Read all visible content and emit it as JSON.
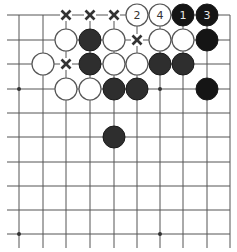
{
  "board": {
    "columns": 10,
    "rows": 10,
    "col_x": [
      19,
      43,
      66,
      90,
      114,
      137,
      160,
      183,
      207,
      230
    ],
    "row_y": [
      15,
      40,
      64,
      89,
      113,
      137,
      162,
      186,
      210,
      234
    ],
    "line_color": "#555555",
    "stone_radius": 11,
    "hoshi": [
      {
        "col": 0,
        "row": 3
      },
      {
        "col": 6,
        "row": 3
      },
      {
        "col": 0,
        "row": 9
      },
      {
        "col": 6,
        "row": 9
      }
    ]
  },
  "stones": [
    {
      "color": "white",
      "col": 5,
      "row": 0,
      "label": "2"
    },
    {
      "color": "white",
      "col": 6,
      "row": 0,
      "label": "4"
    },
    {
      "color": "black",
      "col": 7,
      "row": 0,
      "label": "1",
      "shade": "dark"
    },
    {
      "color": "black",
      "col": 8,
      "row": 0,
      "label": "3",
      "shade": "dark"
    },
    {
      "color": "white",
      "col": 2,
      "row": 1,
      "label": ""
    },
    {
      "color": "black",
      "col": 3,
      "row": 1,
      "label": ""
    },
    {
      "color": "white",
      "col": 4,
      "row": 1,
      "label": ""
    },
    {
      "color": "white",
      "col": 6,
      "row": 1,
      "label": ""
    },
    {
      "color": "white",
      "col": 7,
      "row": 1,
      "label": ""
    },
    {
      "color": "black",
      "col": 8,
      "row": 1,
      "label": "",
      "shade": "dark"
    },
    {
      "color": "white",
      "col": 1,
      "row": 2,
      "label": ""
    },
    {
      "color": "black",
      "col": 3,
      "row": 2,
      "label": ""
    },
    {
      "color": "white",
      "col": 4,
      "row": 2,
      "label": ""
    },
    {
      "color": "white",
      "col": 5,
      "row": 2,
      "label": ""
    },
    {
      "color": "black",
      "col": 6,
      "row": 2,
      "label": ""
    },
    {
      "color": "black",
      "col": 7,
      "row": 2,
      "label": ""
    },
    {
      "color": "white",
      "col": 2,
      "row": 3,
      "label": ""
    },
    {
      "color": "white",
      "col": 3,
      "row": 3,
      "label": ""
    },
    {
      "color": "black",
      "col": 4,
      "row": 3,
      "label": ""
    },
    {
      "color": "black",
      "col": 5,
      "row": 3,
      "label": ""
    },
    {
      "color": "black",
      "col": 8,
      "row": 3,
      "label": "",
      "shade": "dark"
    },
    {
      "color": "black",
      "col": 4,
      "row": 5,
      "label": ""
    }
  ],
  "x_marks": [
    {
      "col": 2,
      "row": 0
    },
    {
      "col": 3,
      "row": 0
    },
    {
      "col": 4,
      "row": 0
    },
    {
      "col": 5,
      "row": 1
    },
    {
      "col": 2,
      "row": 2
    }
  ]
}
